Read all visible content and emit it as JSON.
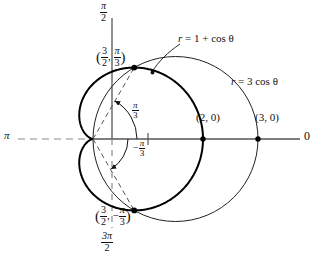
{
  "figure": {
    "type": "polar-graph",
    "colors": {
      "curve": "#000000",
      "axis": "#4d4d4d",
      "dashed_axis": "#7a7a7a",
      "text": "#111111",
      "background": "#ffffff"
    }
  },
  "axes": {
    "pi_half_num": "π",
    "pi_half_den": "2",
    "three_pi_half_num": "3π",
    "three_pi_half_den": "2",
    "pi_label": "π",
    "zero_label": "0"
  },
  "curves": {
    "cardioid": {
      "equation_prefix": "r",
      "equation_body": " = 1 + cos θ",
      "equation_full": "r = 1 + cos θ",
      "polar_form": "r = 1 + cos(theta)",
      "stroke_width": 2.0
    },
    "circle": {
      "equation_prefix": "r",
      "equation_body": " = 3 cos θ",
      "equation_full": "r = 3 cos θ",
      "polar_form": "r = 3 cos(theta)",
      "stroke_width": 1.0
    }
  },
  "points": [
    {
      "name": "cardioid-vertex",
      "label": "(2, 0)",
      "r": "2",
      "theta": "0"
    },
    {
      "name": "circle-rightmost",
      "label": "(3, 0)",
      "r": "3",
      "theta": "0"
    },
    {
      "name": "upper-intersection",
      "r_num": "3",
      "r_den": "2",
      "theta_num": "π",
      "theta_den": "3",
      "label": "(3/2, π/3)"
    },
    {
      "name": "lower-intersection",
      "r_num": "3",
      "r_den": "2",
      "theta_num": "π",
      "theta_den": "3",
      "theta_sign": "−",
      "label": "(3/2, −π/3)"
    }
  ],
  "angles": [
    {
      "name": "positive-angle",
      "num": "π",
      "den": "3",
      "sign": "",
      "value_deg": 60
    },
    {
      "name": "negative-angle",
      "num": "π",
      "den": "3",
      "sign": "−",
      "value_deg": -60
    }
  ],
  "chart_data": {
    "type": "line",
    "title": "",
    "xlabel": "",
    "ylabel": "",
    "coordinate_system": "polar",
    "pole_px": [
      93,
      139
    ],
    "unit_px": 55,
    "series": [
      {
        "name": "r = 1 + cos θ",
        "type": "cardioid",
        "max_r": 2,
        "style": "bold"
      },
      {
        "name": "r = 3 cos θ",
        "type": "circle",
        "max_r": 3,
        "style": "thin"
      }
    ],
    "intersections": [
      {
        "r": 1.5,
        "theta_rad": 1.0471975512,
        "theta_label": "π/3"
      },
      {
        "r": 1.5,
        "theta_rad": -1.0471975512,
        "theta_label": "−π/3"
      },
      {
        "r": 0,
        "theta_label": "pole"
      }
    ],
    "axis_marks": [
      {
        "label": "0",
        "theta_rad": 0
      },
      {
        "label": "π/2",
        "theta_rad": 1.5707963268
      },
      {
        "label": "π",
        "theta_rad": 3.1415926536
      },
      {
        "label": "3π/2",
        "theta_rad": 4.7123889804
      }
    ]
  }
}
